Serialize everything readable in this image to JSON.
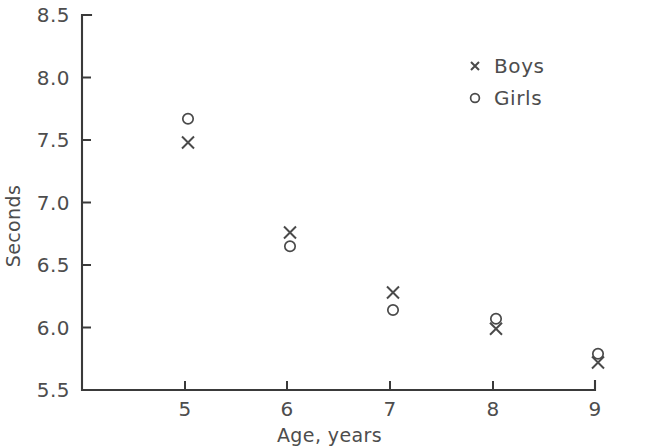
{
  "chart_data": {
    "type": "scatter",
    "title": "",
    "xlabel": "Age, years",
    "ylabel": "Seconds",
    "xlim": [
      4.4,
      9.3
    ],
    "ylim": [
      5.5,
      8.5
    ],
    "xticks": [
      5,
      6,
      7,
      8,
      9
    ],
    "xtick_labels": [
      "5",
      "6",
      "7",
      "8",
      "9"
    ],
    "yticks": [
      5.5,
      6.0,
      6.5,
      7.0,
      7.5,
      8.0,
      8.5
    ],
    "ytick_labels": [
      "5.5",
      "6.0",
      "6.5",
      "7.0",
      "7.5",
      "8.0",
      "8.5"
    ],
    "grid": false,
    "legend_position": "upper right",
    "x": [
      5,
      6,
      7,
      8,
      9
    ],
    "series": [
      {
        "name": "Boys",
        "marker": "x",
        "values": [
          7.48,
          6.76,
          6.28,
          5.99,
          5.72
        ]
      },
      {
        "name": "Girls",
        "marker": "o",
        "values": [
          7.67,
          6.65,
          6.14,
          6.07,
          5.79
        ]
      }
    ]
  },
  "legend": {
    "items": [
      {
        "label": "Boys",
        "marker": "x-marker-icon"
      },
      {
        "label": "Girls",
        "marker": "circle-marker-icon"
      }
    ]
  },
  "colors": {
    "axis": "#3a3a3a",
    "text": "#4d4d4d",
    "marker": "#4a4a4a",
    "background": "#ffffff"
  }
}
